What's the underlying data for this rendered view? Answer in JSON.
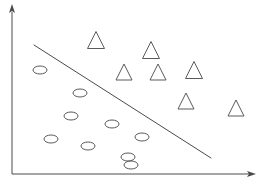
{
  "figure": {
    "title": "",
    "width": 260,
    "height": 185,
    "background_color": "#ffffff"
  },
  "chart_data": {
    "type": "scatter",
    "title": "",
    "subtitle": "",
    "xlabel": "",
    "ylabel": "",
    "xlim": [
      0,
      260
    ],
    "ylim": [
      0,
      185
    ],
    "grid": false,
    "legend": null,
    "axes": {
      "x_axis": {
        "name": "x-axis",
        "from": [
          12,
          174
        ],
        "to": [
          256,
          174
        ],
        "arrow": "right",
        "color": "#4a4a4a",
        "tick_labels": []
      },
      "y_axis": {
        "name": "y-axis",
        "from": [
          12,
          174
        ],
        "to": [
          12,
          6
        ],
        "arrow": "up",
        "color": "#4a4a4a",
        "tick_labels": []
      }
    },
    "decision_boundary": {
      "name": "decision-boundary",
      "type": "line",
      "from": [
        34,
        45
      ],
      "to": [
        211,
        158
      ],
      "color": "#4a4a4a",
      "slope": -0.638
    },
    "series": [
      {
        "name": "triangle-class",
        "marker": "triangle",
        "color": "#5a5a5a",
        "count": 7,
        "points": [
          {
            "x": 96,
            "y": 40,
            "size": 17
          },
          {
            "x": 151,
            "y": 50,
            "size": 17
          },
          {
            "x": 124,
            "y": 72,
            "size": 16
          },
          {
            "x": 158,
            "y": 72,
            "size": 16
          },
          {
            "x": 194,
            "y": 70,
            "size": 17
          },
          {
            "x": 186,
            "y": 101,
            "size": 16
          },
          {
            "x": 236,
            "y": 108,
            "size": 16
          }
        ]
      },
      {
        "name": "ellipse-class",
        "marker": "ellipse",
        "color": "#5a5a5a",
        "count": 9,
        "points": [
          {
            "x": 40,
            "y": 70,
            "rx": 7,
            "ry": 4
          },
          {
            "x": 80,
            "y": 93,
            "rx": 7,
            "ry": 4
          },
          {
            "x": 71,
            "y": 116,
            "rx": 7,
            "ry": 4
          },
          {
            "x": 112,
            "y": 124,
            "rx": 7,
            "ry": 4
          },
          {
            "x": 51,
            "y": 139,
            "rx": 7,
            "ry": 4
          },
          {
            "x": 88,
            "y": 146,
            "rx": 7,
            "ry": 4
          },
          {
            "x": 142,
            "y": 137,
            "rx": 7,
            "ry": 4
          },
          {
            "x": 128,
            "y": 157,
            "rx": 7,
            "ry": 4
          },
          {
            "x": 131,
            "y": 165,
            "rx": 7,
            "ry": 4
          }
        ]
      }
    ]
  }
}
